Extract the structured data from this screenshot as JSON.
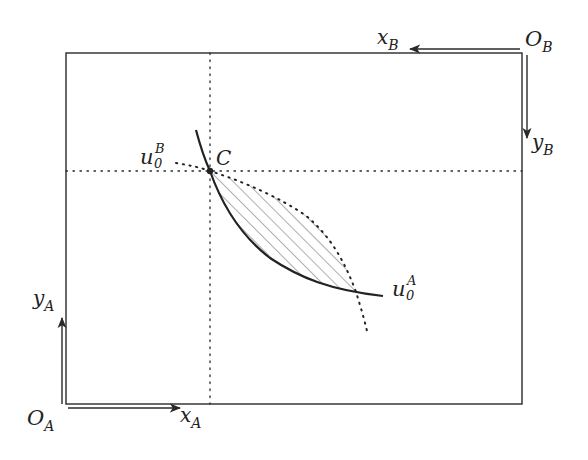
{
  "colors": {
    "ink": "#2a2a2a",
    "hatch": "#666666",
    "background": "#ffffff"
  },
  "origins": {
    "A": {
      "label": "O",
      "sub": "A"
    },
    "B": {
      "label": "O",
      "sub": "B"
    }
  },
  "axes": {
    "xA": {
      "label": "x",
      "sub": "A"
    },
    "yA": {
      "label": "y",
      "sub": "A"
    },
    "xB": {
      "label": "x",
      "sub": "B"
    },
    "yB": {
      "label": "y",
      "sub": "B"
    }
  },
  "point": {
    "label": "C"
  },
  "curves": {
    "uA": {
      "label": "u",
      "sub": "0",
      "sup": "A",
      "style": "solid"
    },
    "uB": {
      "label": "u",
      "sub": "0",
      "sup": "B",
      "style": "dotted"
    }
  },
  "region": {
    "description": "hatched lens between indifference curves (Pareto-improving set)"
  }
}
